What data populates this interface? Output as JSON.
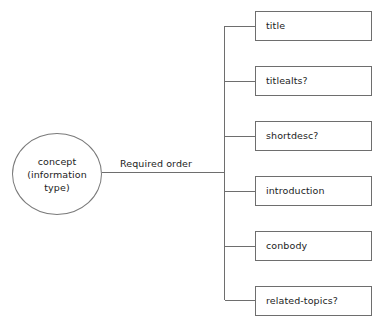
{
  "diagram": {
    "title": "concept (information type) required order",
    "root": {
      "label": "concept\n(information\ntype)",
      "shape": "ellipse"
    },
    "edge": {
      "label": "Required order"
    },
    "children": [
      {
        "label": "title",
        "optional": false,
        "top": 11
      },
      {
        "label": "titlealts?",
        "optional": true,
        "top": 66
      },
      {
        "label": "shortdesc?",
        "optional": true,
        "top": 121
      },
      {
        "label": "introduction",
        "optional": false,
        "top": 176
      },
      {
        "label": "conbody",
        "optional": false,
        "top": 231
      },
      {
        "label": "related-topics?",
        "optional": true,
        "top": 286
      }
    ],
    "colors": {
      "background": "#ffffff",
      "stroke": "#6e6e6e",
      "root_stroke": "#7a7a7a",
      "text": "#1c1c1c"
    }
  }
}
